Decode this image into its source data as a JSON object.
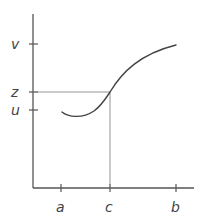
{
  "diagram": {
    "type": "function-graph",
    "colors": {
      "axis": "#555555",
      "curve": "#444444",
      "guide": "#888888",
      "label": "#444444"
    },
    "x_axis": {
      "ticks": [
        {
          "label": "a",
          "x": 61
        },
        {
          "label": "c",
          "x": 110
        },
        {
          "label": "b",
          "x": 176
        }
      ]
    },
    "y_axis": {
      "ticks": [
        {
          "label": "v",
          "y": 44
        },
        {
          "label": "z",
          "y": 92
        },
        {
          "label": "u",
          "y": 110
        }
      ]
    },
    "curve": {
      "start": {
        "x": 62,
        "y": 112
      },
      "intersection": {
        "x": 110,
        "y": 92,
        "label_x": "c",
        "label_y": "z"
      },
      "end": {
        "x": 176,
        "y": 45
      }
    }
  }
}
